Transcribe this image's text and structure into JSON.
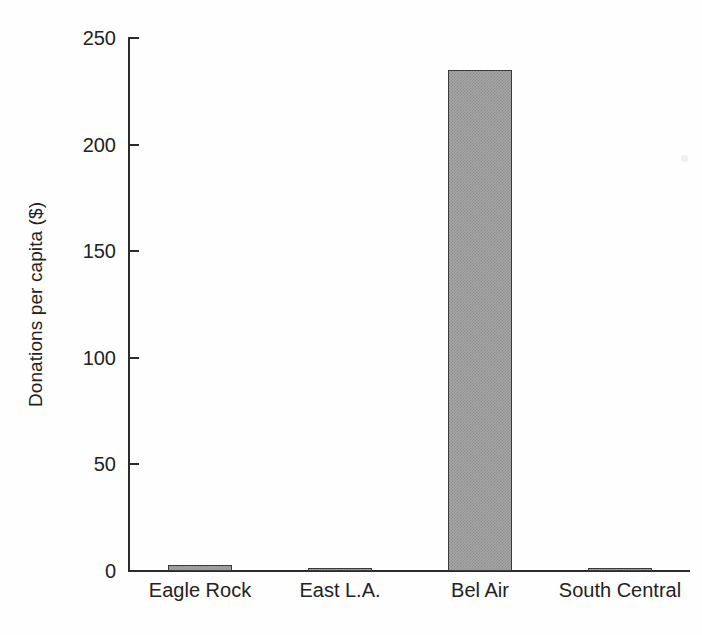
{
  "chart_data": {
    "type": "bar",
    "title": "",
    "subtitle": "",
    "xlabel": "",
    "ylabel": "Donations per capita ($)",
    "categories": [
      "Eagle Rock",
      "East L.A.",
      "Bel Air",
      "South Central"
    ],
    "values": [
      3,
      1,
      235,
      1
    ],
    "series": [
      {
        "name": "Donations per capita",
        "values": [
          3,
          1,
          235,
          1
        ]
      }
    ],
    "ylim": [
      0,
      250
    ],
    "yticks": [
      0,
      50,
      100,
      150,
      200,
      250
    ],
    "ytick_labels": [
      "0",
      "50",
      "100",
      "150",
      "200",
      "250"
    ],
    "grid": false,
    "legend": false,
    "legend_position": "none",
    "bar_fill": "#a6a6a6",
    "bar_edge": "#3a3a3a",
    "axis_color": "#2b2b2b",
    "background": "#ffffff",
    "annotations": []
  }
}
